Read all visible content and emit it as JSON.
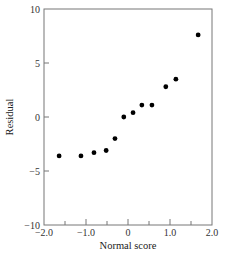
{
  "chart_data": {
    "type": "scatter",
    "title": "",
    "xlabel": "Normal score",
    "ylabel": "Residual",
    "xlim": [
      -2.0,
      2.0
    ],
    "ylim": [
      -10,
      10
    ],
    "grid": false,
    "legend": null,
    "xticks": [
      -2.0,
      -1.5,
      -1.0,
      -0.5,
      0,
      0.5,
      1.0,
      1.5,
      2.0
    ],
    "xtick_labels": [
      "−2.0",
      "−1.0",
      "0",
      "1.0",
      "2.0"
    ],
    "ytick_labels": [
      "10",
      "5",
      "0",
      "−5",
      "−10"
    ],
    "yticks": [
      10,
      5,
      0,
      -5,
      -10
    ],
    "points": [
      {
        "x": -1.64,
        "y": -3.6
      },
      {
        "x": -1.12,
        "y": -3.6
      },
      {
        "x": -0.81,
        "y": -3.3
      },
      {
        "x": -0.52,
        "y": -3.1
      },
      {
        "x": -0.31,
        "y": -2.0
      },
      {
        "x": -0.1,
        "y": 0.0
      },
      {
        "x": 0.12,
        "y": 0.4
      },
      {
        "x": 0.33,
        "y": 1.1
      },
      {
        "x": 0.57,
        "y": 1.1
      },
      {
        "x": 0.9,
        "y": 2.8
      },
      {
        "x": 1.14,
        "y": 3.5
      },
      {
        "x": 1.67,
        "y": 7.6
      }
    ],
    "marker_color": "#000000",
    "frame_color": "#777777"
  }
}
